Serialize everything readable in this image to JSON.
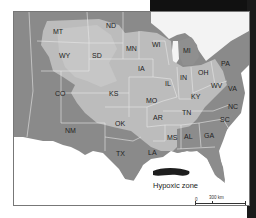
{
  "map": {
    "title": "Mississippi River basin and Gulf of Mexico hypoxic zone",
    "colors": {
      "dark_region": "#8a8a8a",
      "basin_light": "#b9b9b9",
      "basin_lighter": "#c9c9c9",
      "water": "#ffffff",
      "hypoxic_zone": "#1e1e1e",
      "state_border": "#e6e6e6",
      "frame_black": "#111111"
    },
    "states": [
      {
        "abbr": "MT",
        "x": 58,
        "y": 32
      },
      {
        "abbr": "ND",
        "x": 111,
        "y": 26
      },
      {
        "abbr": "WY",
        "x": 64,
        "y": 56
      },
      {
        "abbr": "SD",
        "x": 97,
        "y": 56
      },
      {
        "abbr": "MN",
        "x": 131,
        "y": 49
      },
      {
        "abbr": "WI",
        "x": 157,
        "y": 45
      },
      {
        "abbr": "MI",
        "x": 188,
        "y": 51
      },
      {
        "abbr": "IA",
        "x": 143,
        "y": 69
      },
      {
        "abbr": "CO",
        "x": 60,
        "y": 94
      },
      {
        "abbr": "KS",
        "x": 114,
        "y": 94
      },
      {
        "abbr": "IL",
        "x": 170,
        "y": 84
      },
      {
        "abbr": "IN",
        "x": 185,
        "y": 78
      },
      {
        "abbr": "OH",
        "x": 203,
        "y": 73
      },
      {
        "abbr": "PA",
        "x": 226,
        "y": 64
      },
      {
        "abbr": "WV",
        "x": 216,
        "y": 86
      },
      {
        "abbr": "VA",
        "x": 233,
        "y": 89
      },
      {
        "abbr": "MO",
        "x": 151,
        "y": 101
      },
      {
        "abbr": "KY",
        "x": 196,
        "y": 97
      },
      {
        "abbr": "NC",
        "x": 233,
        "y": 107
      },
      {
        "abbr": "TN",
        "x": 187,
        "y": 113
      },
      {
        "abbr": "AR",
        "x": 158,
        "y": 118
      },
      {
        "abbr": "OK",
        "x": 120,
        "y": 124
      },
      {
        "abbr": "SC",
        "x": 225,
        "y": 120
      },
      {
        "abbr": "NM",
        "x": 70,
        "y": 131
      },
      {
        "abbr": "MS",
        "x": 172,
        "y": 138
      },
      {
        "abbr": "AL",
        "x": 189,
        "y": 137
      },
      {
        "abbr": "GA",
        "x": 209,
        "y": 136
      },
      {
        "abbr": "TX",
        "x": 121,
        "y": 154
      },
      {
        "abbr": "LA",
        "x": 153,
        "y": 153
      }
    ],
    "hypoxic_label": "Hypoxic zone",
    "scale": {
      "zero_km": "0",
      "km_label": "300 km",
      "zero_mi": "0",
      "mi_label": "300 miles"
    }
  }
}
